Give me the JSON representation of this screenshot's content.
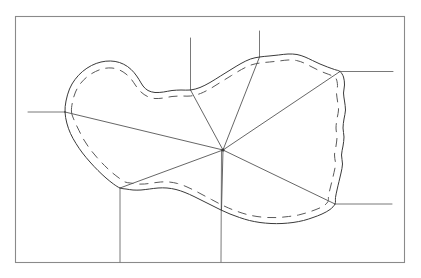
{
  "figure": {
    "background_color": "#ffffff",
    "frame": {
      "name": "outer-border",
      "x": 15.5,
      "y": 16.5,
      "width": 389,
      "height": 246,
      "stroke_color": "#8a8a8a",
      "stroke_width": 1.1
    },
    "hub": {
      "label": "central-convergence-point",
      "x": 223,
      "y": 150,
      "radius": 1.6,
      "color": "#3a3a3a"
    },
    "region_outline": {
      "label": "solid-region-boundary",
      "stroke_color": "#3a3a3a",
      "stroke_width": 1.0,
      "points": [
        [
          65.0,
          112.0
        ],
        [
          66.0,
          101.0
        ],
        [
          69.5,
          89.0
        ],
        [
          75.0,
          79.5
        ],
        [
          82.5,
          71.5
        ],
        [
          91.5,
          65.5
        ],
        [
          101.0,
          62.0
        ],
        [
          110.5,
          61.0
        ],
        [
          119.5,
          62.5
        ],
        [
          127.5,
          66.5
        ],
        [
          134.0,
          72.5
        ],
        [
          139.0,
          79.5
        ],
        [
          143.0,
          86.0
        ],
        [
          148.0,
          90.5
        ],
        [
          155.0,
          92.5
        ],
        [
          163.5,
          92.0
        ],
        [
          172.0,
          90.5
        ],
        [
          181.0,
          90.0
        ],
        [
          190.5,
          90.0
        ],
        [
          200.0,
          87.5
        ],
        [
          210.0,
          82.5
        ],
        [
          220.5,
          76.0
        ],
        [
          231.0,
          69.5
        ],
        [
          241.0,
          63.5
        ],
        [
          250.5,
          59.0
        ],
        [
          259.5,
          57.0
        ],
        [
          269.0,
          56.0
        ],
        [
          278.5,
          55.0
        ],
        [
          288.0,
          54.0
        ],
        [
          297.0,
          54.5
        ],
        [
          305.0,
          57.0
        ],
        [
          312.5,
          60.5
        ],
        [
          320.0,
          64.0
        ],
        [
          327.5,
          67.0
        ],
        [
          334.5,
          69.5
        ],
        [
          340.0,
          71.5
        ],
        [
          343.5,
          77.0
        ],
        [
          344.5,
          85.0
        ],
        [
          343.5,
          93.0
        ],
        [
          344.5,
          101.0
        ],
        [
          345.5,
          110.0
        ],
        [
          344.0,
          119.0
        ],
        [
          343.0,
          128.0
        ],
        [
          344.0,
          137.0
        ],
        [
          343.0,
          146.0
        ],
        [
          341.5,
          155.0
        ],
        [
          342.5,
          164.0
        ],
        [
          341.0,
          173.0
        ],
        [
          339.0,
          181.5
        ],
        [
          337.0,
          190.0
        ],
        [
          335.5,
          197.5
        ],
        [
          335.0,
          204.0
        ],
        [
          330.0,
          209.5
        ],
        [
          322.0,
          214.0
        ],
        [
          313.0,
          217.5
        ],
        [
          303.5,
          220.5
        ],
        [
          293.0,
          222.5
        ],
        [
          282.0,
          223.5
        ],
        [
          271.0,
          223.5
        ],
        [
          260.0,
          222.5
        ],
        [
          249.5,
          220.5
        ],
        [
          239.5,
          217.5
        ],
        [
          230.0,
          214.0
        ],
        [
          221.0,
          210.0
        ],
        [
          212.0,
          205.5
        ],
        [
          203.0,
          201.0
        ],
        [
          194.0,
          196.5
        ],
        [
          185.0,
          192.5
        ],
        [
          176.0,
          189.5
        ],
        [
          167.0,
          188.0
        ],
        [
          158.0,
          188.0
        ],
        [
          149.5,
          189.0
        ],
        [
          141.0,
          190.0
        ],
        [
          133.0,
          190.0
        ],
        [
          126.0,
          189.0
        ],
        [
          120.0,
          188.0
        ],
        [
          113.5,
          184.0
        ],
        [
          106.0,
          178.0
        ],
        [
          98.0,
          170.5
        ],
        [
          90.0,
          162.0
        ],
        [
          82.5,
          153.0
        ],
        [
          76.0,
          143.5
        ],
        [
          70.5,
          133.5
        ],
        [
          66.8,
          123.0
        ],
        [
          65.0,
          112.0
        ]
      ]
    },
    "region_inner_dashed": {
      "label": "dashed-inner-offset-curve",
      "stroke_color": "#5a5a5a",
      "stroke_width": 1.0,
      "dash_pattern": "9 6",
      "points": [
        [
          71.5,
          112.0
        ],
        [
          72.5,
          102.0
        ],
        [
          75.5,
          92.0
        ],
        [
          80.5,
          83.5
        ],
        [
          87.5,
          76.5
        ],
        [
          95.5,
          71.5
        ],
        [
          104.0,
          68.5
        ],
        [
          112.0,
          68.0
        ],
        [
          119.5,
          70.0
        ],
        [
          126.0,
          74.0
        ],
        [
          131.5,
          79.5
        ],
        [
          136.0,
          86.0
        ],
        [
          141.0,
          92.0
        ],
        [
          147.5,
          96.5
        ],
        [
          155.0,
          98.5
        ],
        [
          163.5,
          98.0
        ],
        [
          172.0,
          96.5
        ],
        [
          181.0,
          96.0
        ],
        [
          190.5,
          96.0
        ],
        [
          200.5,
          93.5
        ],
        [
          210.5,
          88.5
        ],
        [
          221.0,
          82.0
        ],
        [
          231.5,
          75.5
        ],
        [
          241.5,
          69.5
        ],
        [
          251.0,
          65.0
        ],
        [
          260.0,
          63.0
        ],
        [
          269.5,
          62.0
        ],
        [
          279.0,
          61.0
        ],
        [
          288.0,
          60.0
        ],
        [
          296.5,
          60.5
        ],
        [
          304.0,
          63.0
        ],
        [
          311.0,
          66.5
        ],
        [
          318.0,
          70.0
        ],
        [
          325.0,
          73.0
        ],
        [
          331.5,
          75.5
        ],
        [
          336.0,
          78.5
        ],
        [
          337.5,
          85.5
        ],
        [
          336.5,
          93.0
        ],
        [
          337.5,
          101.0
        ],
        [
          338.5,
          110.0
        ],
        [
          337.0,
          119.0
        ],
        [
          336.0,
          128.0
        ],
        [
          337.0,
          137.0
        ],
        [
          336.0,
          146.0
        ],
        [
          334.5,
          155.0
        ],
        [
          335.5,
          164.0
        ],
        [
          334.0,
          172.5
        ],
        [
          332.0,
          181.0
        ],
        [
          330.0,
          189.0
        ],
        [
          328.5,
          196.0
        ],
        [
          328.0,
          201.5
        ],
        [
          323.5,
          206.0
        ],
        [
          316.0,
          209.5
        ],
        [
          307.5,
          212.5
        ],
        [
          298.5,
          215.0
        ],
        [
          288.5,
          216.5
        ],
        [
          278.0,
          217.5
        ],
        [
          267.5,
          217.5
        ],
        [
          257.0,
          216.5
        ],
        [
          247.0,
          214.5
        ],
        [
          237.5,
          211.5
        ],
        [
          228.5,
          208.0
        ],
        [
          220.0,
          204.0
        ],
        [
          211.5,
          199.5
        ],
        [
          203.0,
          195.0
        ],
        [
          194.5,
          190.5
        ],
        [
          186.0,
          186.5
        ],
        [
          177.5,
          183.5
        ],
        [
          169.0,
          182.0
        ],
        [
          160.5,
          182.0
        ],
        [
          152.5,
          183.0
        ],
        [
          144.5,
          184.0
        ],
        [
          137.0,
          184.0
        ],
        [
          130.5,
          183.0
        ],
        [
          125.0,
          182.0
        ],
        [
          119.0,
          178.0
        ],
        [
          112.0,
          172.5
        ],
        [
          104.5,
          165.5
        ],
        [
          97.0,
          157.5
        ],
        [
          90.0,
          149.0
        ],
        [
          84.0,
          140.0
        ],
        [
          79.0,
          130.5
        ],
        [
          74.5,
          121.0
        ],
        [
          71.5,
          112.0
        ]
      ]
    },
    "spokes": [
      {
        "name": "spoke-to-west",
        "from": [
          223,
          150
        ],
        "to": [
          65.0,
          112.0
        ]
      },
      {
        "name": "spoke-to-north-west",
        "from": [
          223,
          150
        ],
        "to": [
          190.5,
          90.0
        ]
      },
      {
        "name": "spoke-to-north",
        "from": [
          223,
          150
        ],
        "to": [
          259.5,
          57.0
        ]
      },
      {
        "name": "spoke-to-north-east",
        "from": [
          223,
          150
        ],
        "to": [
          340.0,
          71.5
        ]
      },
      {
        "name": "spoke-to-south-east",
        "from": [
          223,
          150
        ],
        "to": [
          335.0,
          204.0
        ]
      },
      {
        "name": "spoke-to-south",
        "from": [
          223,
          150
        ],
        "to": [
          221.5,
          210.0
        ]
      },
      {
        "name": "spoke-to-south-west",
        "from": [
          223,
          150
        ],
        "to": [
          120.0,
          188.0
        ]
      }
    ],
    "leaders": [
      {
        "name": "leader-west-horizontal",
        "orientation": "horizontal",
        "from": [
          28.0,
          112.0
        ],
        "to": [
          65.0,
          112.0
        ]
      },
      {
        "name": "leader-north-west-vertical",
        "orientation": "vertical",
        "from": [
          190.5,
          38.0
        ],
        "to": [
          190.5,
          90.0
        ]
      },
      {
        "name": "leader-north-vertical",
        "orientation": "vertical",
        "from": [
          259.5,
          31.0
        ],
        "to": [
          259.5,
          57.0
        ]
      },
      {
        "name": "leader-north-east-horizontal",
        "orientation": "horizontal",
        "from": [
          340.0,
          71.5
        ],
        "to": [
          393.0,
          71.5
        ]
      },
      {
        "name": "leader-south-east-horizontal",
        "orientation": "horizontal",
        "from": [
          335.0,
          204.0
        ],
        "to": [
          392.0,
          204.0
        ]
      },
      {
        "name": "leader-south-vertical",
        "orientation": "vertical",
        "from": [
          221.5,
          150.0
        ],
        "to": [
          221.0,
          262.0
        ]
      },
      {
        "name": "leader-south-west-vertical",
        "orientation": "vertical",
        "from": [
          120.0,
          188.0
        ],
        "to": [
          120.0,
          262.0
        ]
      }
    ]
  }
}
